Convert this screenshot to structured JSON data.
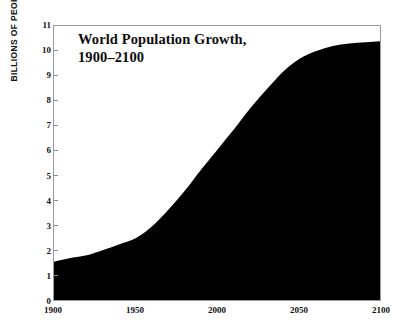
{
  "chart_data": {
    "type": "area",
    "title": "World Population Growth,",
    "title_line2": "1900–2100",
    "xlabel": "",
    "ylabel": "BILLIONS OF PEOPLE",
    "xlim": [
      1900,
      2100
    ],
    "ylim": [
      0,
      11
    ],
    "grid": false,
    "legend": null,
    "xticks": [
      1900,
      1950,
      2000,
      2050,
      2100
    ],
    "yticks": [
      0,
      1,
      2,
      3,
      4,
      5,
      6,
      7,
      8,
      9,
      10,
      11
    ],
    "fill_color": "#000000",
    "frame_color": "#9a9a9a",
    "background": "#ffffff",
    "series": [
      {
        "name": "World population",
        "x": [
          1900,
          1910,
          1920,
          1930,
          1940,
          1950,
          1960,
          1970,
          1980,
          1990,
          2000,
          2010,
          2020,
          2030,
          2040,
          2050,
          2060,
          2070,
          2080,
          2090,
          2100
        ],
        "values": [
          1.6,
          1.75,
          1.86,
          2.07,
          2.3,
          2.55,
          3.03,
          3.7,
          4.45,
          5.3,
          6.1,
          6.9,
          7.75,
          8.5,
          9.2,
          9.7,
          10.0,
          10.2,
          10.3,
          10.35,
          10.4
        ]
      }
    ]
  },
  "axis": {
    "y_title": "BILLIONS OF PEOPLE",
    "y_labels": [
      "11",
      "10",
      "9",
      "8",
      "7",
      "6",
      "5",
      "4",
      "3",
      "2",
      "1",
      "0"
    ],
    "x_labels": [
      "1900",
      "1950",
      "2000",
      "2050",
      "2100"
    ]
  }
}
